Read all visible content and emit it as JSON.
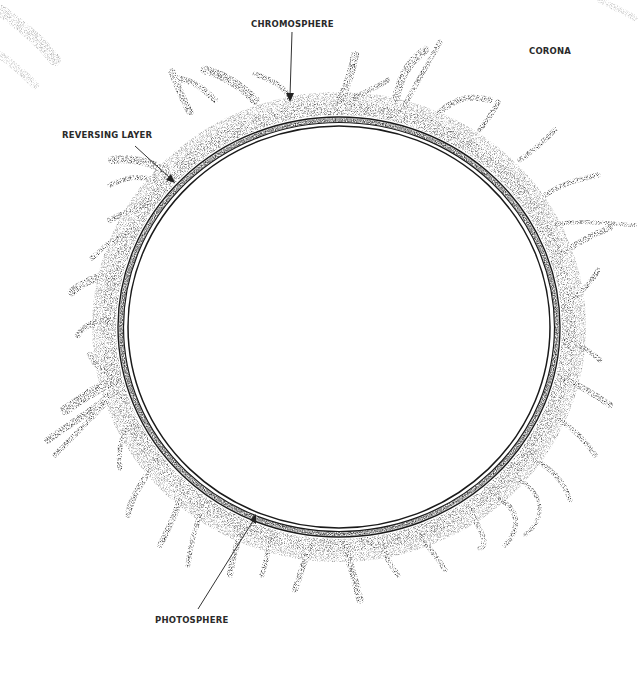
{
  "diagram": {
    "labels": {
      "chromosphere": "CHROMOSPHERE",
      "corona": "CORONA",
      "reversing_layer": "REVERSING LAYER",
      "photosphere": "PHOTOSPHERE"
    },
    "colors": {
      "background": "#ffffff",
      "ink": "#1a1a1a",
      "stipple": "#3a3a3a",
      "label": "#2a2a2a"
    },
    "geometry": {
      "center": [
        339,
        327
      ],
      "chromosphere_band_radius": [
        221,
        210
      ],
      "photosphere_line_radius": [
        213,
        203
      ]
    }
  }
}
